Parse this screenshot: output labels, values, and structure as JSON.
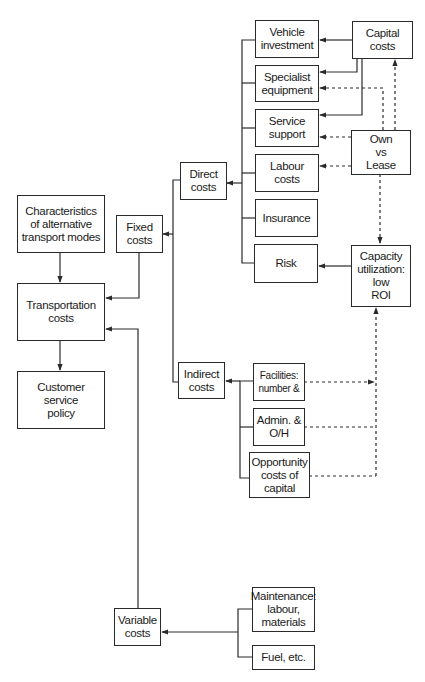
{
  "diagram": {
    "type": "flow-diagram",
    "nodes": {
      "characteristics": "Characteristics\nof alternative\ntransport modes",
      "transportation_costs": "Transportation\ncosts",
      "customer_service_policy": "Customer\nservice\npolicy",
      "fixed_costs": "Fixed\ncosts",
      "variable_costs": "Variable\ncosts",
      "direct_costs": "Direct\ncosts",
      "indirect_costs": "Indirect\ncosts",
      "vehicle_investment": "Vehicle\ninvestment",
      "specialist_equipment": "Specialist\nequipment",
      "service_support": "Service\nsupport",
      "labour_costs": "Labour\ncosts",
      "insurance": "Insurance",
      "risk": "Risk",
      "capital_costs": "Capital\ncosts",
      "own_vs_lease": "Own\nvs\nLease",
      "capacity_utilization": "Capacity\nutilization:\nlow\nROI",
      "facilities": "Facilities:\nnumber &",
      "admin_oh": "Admin. &\nO/H",
      "opportunity_costs": "Opportunity\ncosts of\ncapital",
      "maintenance": "Maintenance:\nlabour,\nmaterials",
      "fuel": "Fuel, etc."
    },
    "edges": [
      {
        "from": "characteristics",
        "to": "transportation_costs",
        "style": "solid"
      },
      {
        "from": "transportation_costs",
        "to": "customer_service_policy",
        "style": "solid"
      },
      {
        "from": "fixed_costs",
        "to": "transportation_costs",
        "style": "solid"
      },
      {
        "from": "variable_costs",
        "to": "transportation_costs",
        "style": "solid"
      },
      {
        "from": "direct_costs",
        "to": "fixed_costs",
        "style": "solid"
      },
      {
        "from": "indirect_costs",
        "to": "fixed_costs",
        "style": "solid"
      },
      {
        "from": "vehicle_investment",
        "to": "direct_costs",
        "style": "solid"
      },
      {
        "from": "specialist_equipment",
        "to": "direct_costs",
        "style": "solid"
      },
      {
        "from": "service_support",
        "to": "direct_costs",
        "style": "solid"
      },
      {
        "from": "labour_costs",
        "to": "direct_costs",
        "style": "solid"
      },
      {
        "from": "insurance",
        "to": "direct_costs",
        "style": "solid"
      },
      {
        "from": "risk",
        "to": "direct_costs",
        "style": "solid"
      },
      {
        "from": "capital_costs",
        "to": "vehicle_investment",
        "style": "solid"
      },
      {
        "from": "capital_costs",
        "to": "specialist_equipment",
        "style": "solid"
      },
      {
        "from": "capital_costs",
        "to": "service_support",
        "style": "solid"
      },
      {
        "from": "own_vs_lease",
        "to": "capital_costs",
        "style": "dashed"
      },
      {
        "from": "own_vs_lease",
        "to": "specialist_equipment",
        "style": "dashed"
      },
      {
        "from": "own_vs_lease",
        "to": "service_support",
        "style": "dashed"
      },
      {
        "from": "own_vs_lease",
        "to": "labour_costs",
        "style": "dashed"
      },
      {
        "from": "own_vs_lease",
        "to": "capacity_utilization",
        "style": "dashed"
      },
      {
        "from": "capacity_utilization",
        "to": "risk",
        "style": "solid"
      },
      {
        "from": "facilities",
        "to": "indirect_costs",
        "style": "solid"
      },
      {
        "from": "admin_oh",
        "to": "indirect_costs",
        "style": "solid"
      },
      {
        "from": "opportunity_costs",
        "to": "indirect_costs",
        "style": "solid"
      },
      {
        "from": "facilities",
        "to": "capacity_utilization",
        "style": "dashed"
      },
      {
        "from": "admin_oh",
        "to": "capacity_utilization",
        "style": "dashed"
      },
      {
        "from": "opportunity_costs",
        "to": "capacity_utilization",
        "style": "dashed"
      },
      {
        "from": "maintenance",
        "to": "variable_costs",
        "style": "solid"
      },
      {
        "from": "fuel",
        "to": "variable_costs",
        "style": "solid"
      }
    ]
  }
}
